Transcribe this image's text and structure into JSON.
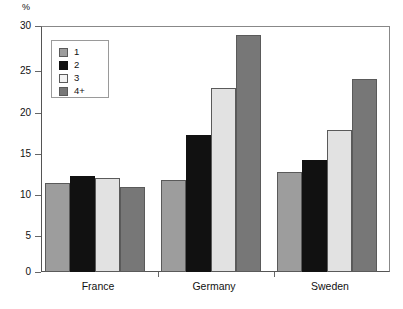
{
  "chart_data": {
    "type": "bar",
    "title": "",
    "subtitle": "",
    "xlabel": "",
    "ylabel": "%",
    "unit_label": "%",
    "ylim": [
      0,
      30
    ],
    "ytick_values": [
      0,
      5,
      10,
      15,
      20,
      25,
      30
    ],
    "ytick_labels": [
      "0",
      "5",
      "10",
      "15",
      "20",
      "25",
      "30"
    ],
    "grid": true,
    "grid_axis": "y",
    "legend_position": "upper-left-inside",
    "categories": [
      "France",
      "Germany",
      "Sweden"
    ],
    "series": [
      {
        "name": "1",
        "color": "#9d9d9d",
        "values": [
          10.9,
          11.2,
          12.2
        ]
      },
      {
        "name": "2",
        "color": "#111111",
        "values": [
          11.7,
          16.7,
          13.6
        ]
      },
      {
        "name": "3",
        "color": "#e2e2e2",
        "values": [
          11.5,
          22.4,
          17.3
        ]
      },
      {
        "name": "4+",
        "color": "#777777",
        "values": [
          10.4,
          28.9,
          23.5
        ]
      }
    ]
  },
  "legend": {
    "entries": [
      {
        "label": "1",
        "swatch": "s1"
      },
      {
        "label": "2",
        "swatch": "s2"
      },
      {
        "label": "3",
        "swatch": "s3"
      },
      {
        "label": "4+",
        "swatch": "s4"
      }
    ]
  },
  "axes": {
    "y_unit": "%",
    "y_labels": [
      "30",
      "25",
      "20",
      "15",
      "10",
      "5",
      "0"
    ],
    "x_labels": [
      "France",
      "Germany",
      "Sweden"
    ]
  }
}
